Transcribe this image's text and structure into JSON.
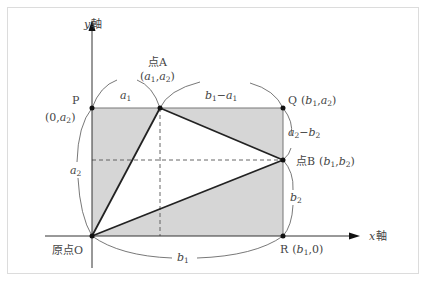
{
  "diagram": {
    "axes": {
      "x_label_var": "x",
      "x_label_text": "軸",
      "y_label_var": "y",
      "y_label_text": "軸"
    },
    "points": {
      "origin": {
        "label": "原点O"
      },
      "P": {
        "name": "P",
        "coord_open": "(0,",
        "coord_var": "a",
        "coord_sub": "2",
        "coord_close": ")"
      },
      "Q": {
        "name": "Q",
        "coord_open": "(",
        "v1": "b",
        "s1": "1",
        "v2": "a",
        "s2": "2",
        "coord_close": ")"
      },
      "R": {
        "name": "R",
        "coord_open": "(",
        "v1": "b",
        "s1": "1",
        "tail": ",0)"
      },
      "A": {
        "name": "点A",
        "coord_open": "(",
        "v1": "a",
        "s1": "1",
        "v2": "a",
        "s2": "2",
        "coord_close": ")"
      },
      "B": {
        "name": "点B",
        "coord_open": "(",
        "v1": "b",
        "s1": "1",
        "v2": "b",
        "s2": "2",
        "coord_close": ")"
      }
    },
    "lengths": {
      "a1": {
        "v": "a",
        "s": "1"
      },
      "b1_minus_a1": {
        "v1": "b",
        "s1": "1",
        "op": "−",
        "v2": "a",
        "s2": "1"
      },
      "a2_minus_b2": {
        "v1": "a",
        "s1": "2",
        "op": "−",
        "v2": "b",
        "s2": "2"
      },
      "b2": {
        "v": "b",
        "s": "2"
      },
      "a2": {
        "v": "a",
        "s": "2"
      },
      "b1": {
        "v": "b",
        "s": "1"
      }
    },
    "colors": {
      "fill": "#d6d6d6",
      "stroke": "#222222",
      "thin": "#555555",
      "dashed": "#444444"
    }
  }
}
